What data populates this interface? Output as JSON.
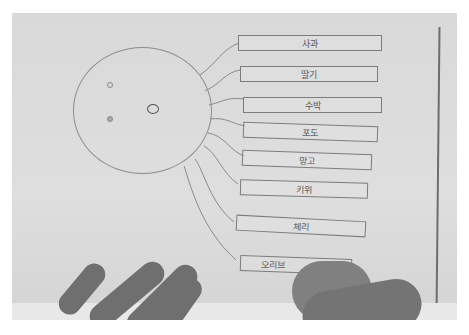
{
  "scene": {
    "description": "Photo of a hand-drawn mind map on paper: a circle (octopus-like head) with lines branching to rectangular label boxes containing Korean fruit names; a hand is writing in the bottom box.",
    "paper_color": "#dcdcdc",
    "ink_color": "#7c7c7c"
  },
  "diagram": {
    "center_shape": "circle-face",
    "labels": [
      {
        "text": "사과"
      },
      {
        "text": "딸기"
      },
      {
        "text": "수박"
      },
      {
        "text": "포도"
      },
      {
        "text": "망고"
      },
      {
        "text": "키위"
      },
      {
        "text": "체리"
      },
      {
        "text": "오리브"
      }
    ]
  }
}
